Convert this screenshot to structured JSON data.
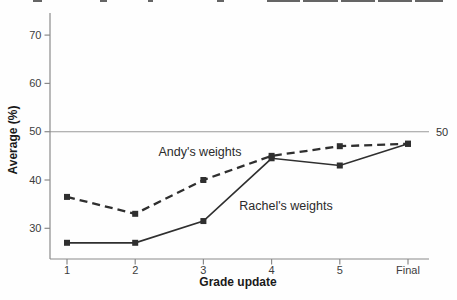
{
  "chart_data": {
    "type": "line",
    "categories": [
      "1",
      "2",
      "3",
      "4",
      "5",
      "Final"
    ],
    "series": [
      {
        "name": "Andy's weights",
        "values": [
          36.5,
          33,
          40,
          45,
          47,
          47.5
        ],
        "line_style": "dashed",
        "marker": "square"
      },
      {
        "name": "Rachel's weights",
        "values": [
          27,
          27,
          31.5,
          44.5,
          43,
          47.5
        ],
        "line_style": "solid",
        "marker": "square"
      }
    ],
    "xlabel": "Grade update",
    "ylabel": "Average (%)",
    "y_ticks": [
      30,
      40,
      50,
      60,
      70
    ],
    "ylim": [
      24,
      74
    ],
    "ref_line": {
      "value": 50,
      "label": "50"
    },
    "legend": "inline-annotations",
    "grid": false,
    "colors": {
      "line": "#2f2f2f",
      "axis": "#8a8a8a",
      "ref_line": "#9a9a9a",
      "tick_text": "#3d3d3d"
    }
  }
}
